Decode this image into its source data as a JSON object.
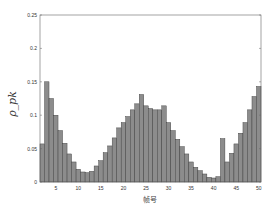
{
  "chart_data": {
    "type": "bar",
    "title": "",
    "xlabel": "帧号",
    "ylabel": "ρ_pk",
    "ylim": [
      0,
      0.25
    ],
    "xlim": [
      1.5,
      50.5
    ],
    "xticks": [
      5,
      10,
      15,
      20,
      25,
      30,
      35,
      40,
      45,
      50
    ],
    "yticks": [
      0,
      0.05,
      0.1,
      0.15,
      0.2,
      0.25
    ],
    "ytick_labels": [
      "0",
      "0.05",
      "0.1",
      "0.15",
      "0.2",
      "0.25"
    ],
    "grid": false,
    "bar_color": "#8c8c8c",
    "categories": [
      2,
      3,
      4,
      5,
      6,
      7,
      8,
      9,
      10,
      11,
      12,
      13,
      14,
      15,
      16,
      17,
      18,
      19,
      20,
      21,
      22,
      23,
      24,
      25,
      26,
      27,
      28,
      29,
      30,
      31,
      32,
      33,
      34,
      35,
      36,
      37,
      38,
      39,
      40,
      41,
      42,
      43,
      44,
      45,
      46,
      47,
      48,
      49,
      50
    ],
    "values": [
      0.057,
      0.15,
      0.125,
      0.1,
      0.077,
      0.058,
      0.042,
      0.03,
      0.019,
      0.015,
      0.014,
      0.016,
      0.024,
      0.032,
      0.044,
      0.054,
      0.066,
      0.081,
      0.089,
      0.098,
      0.108,
      0.117,
      0.131,
      0.114,
      0.11,
      0.108,
      0.108,
      0.114,
      0.089,
      0.077,
      0.064,
      0.053,
      0.042,
      0.03,
      0.022,
      0.017,
      0.012,
      0.007,
      0.006,
      0.008,
      0.065,
      0.03,
      0.043,
      0.057,
      0.073,
      0.089,
      0.108,
      0.128,
      0.143
    ]
  }
}
